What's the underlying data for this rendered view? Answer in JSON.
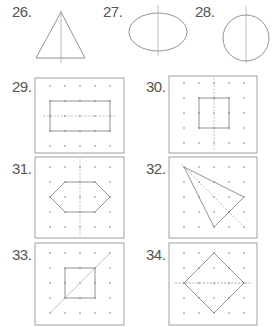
{
  "exercises": [
    {
      "number": "26.",
      "shape": "isosceles-triangle",
      "symmetry_line": "vertical"
    },
    {
      "number": "27.",
      "shape": "ellipse",
      "symmetry_line": "vertical"
    },
    {
      "number": "28.",
      "shape": "circle",
      "symmetry_line": "vertical"
    },
    {
      "number": "29.",
      "shape": "rectangle-on-dot-grid",
      "symmetry_line": "horizontal"
    },
    {
      "number": "30.",
      "shape": "square-on-dot-grid",
      "symmetry_line": "vertical"
    },
    {
      "number": "31.",
      "shape": "hexagon-on-dot-grid",
      "symmetry_line": "vertical"
    },
    {
      "number": "32.",
      "shape": "kite-triangle-on-dot-grid",
      "symmetry_line": "diagonal"
    },
    {
      "number": "33.",
      "shape": "square-on-dot-grid",
      "symmetry_line": "diagonal"
    },
    {
      "number": "34.",
      "shape": "rhombus-on-dot-grid",
      "symmetry_line": "horizontal"
    }
  ],
  "colors": {
    "line": "#777777",
    "dot": "#aaaaaa",
    "label": "#555555",
    "frame": "#888888"
  }
}
